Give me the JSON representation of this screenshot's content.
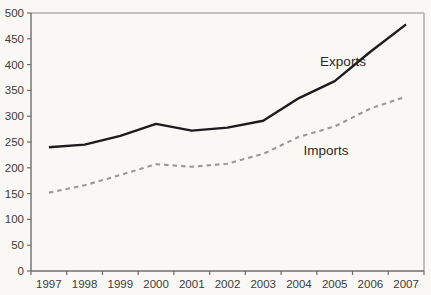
{
  "figure": {
    "kind": "line-chart-scan",
    "background": "#f9f8f5"
  },
  "chart_data": {
    "type": "line",
    "title": "",
    "xlabel": "",
    "ylabel": "",
    "categories": [
      "1997",
      "1998",
      "1999",
      "2000",
      "2001",
      "2002",
      "2003",
      "2004",
      "2005",
      "2006",
      "2007"
    ],
    "series": [
      {
        "name": "Exports",
        "line_style": "solid",
        "color": "#1c1c1c",
        "values": [
          240,
          245,
          262,
          285,
          272,
          278,
          291,
          335,
          368,
          425,
          478
        ]
      },
      {
        "name": "Imports",
        "line_style": "dashed",
        "color": "#989896",
        "values": [
          152,
          166,
          186,
          207,
          202,
          208,
          227,
          260,
          280,
          315,
          338
        ]
      }
    ],
    "ylim": [
      0,
      500
    ],
    "ytick_interval": 50,
    "ytick_labels": [
      "0",
      "50",
      "100",
      "150",
      "200",
      "250",
      "300",
      "350",
      "400",
      "450",
      "500"
    ],
    "grid": false,
    "legend": "inline-labels",
    "plot_border": true
  },
  "colors": {
    "axis": "#6e6e69",
    "plot_border": "#b2b1ac",
    "tick_label": "#3b3b38",
    "series_label": "#2a2a28"
  }
}
